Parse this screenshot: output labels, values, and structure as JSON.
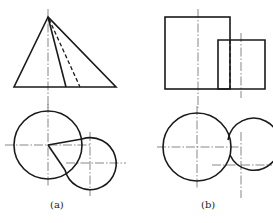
{
  "figure": {
    "line_color": "#1a1a1a",
    "centerline_color": "#555555",
    "panels": [
      {
        "id": "a",
        "caption": "(a)",
        "front_view": {
          "shape": "triangle (cone/pyramid front view)",
          "apex": [
            48,
            17
          ],
          "base_left": [
            14,
            87
          ],
          "base_right": [
            116,
            87
          ],
          "visible_edge_end": [
            66,
            87
          ],
          "hidden_edge_end": [
            80,
            87
          ],
          "centerline_x": 48
        },
        "top_view": {
          "large_circle": {
            "cx": 48,
            "cy": 145,
            "r": 34
          },
          "small_circle": {
            "cx": 90,
            "cy": 163,
            "r": 26
          },
          "radial_lines_to": [
            [
              82,
              139
            ],
            [
              65,
              170
            ]
          ]
        }
      },
      {
        "id": "b",
        "caption": "(b)",
        "front_view": {
          "large_rect": {
            "x": 165,
            "y": 17,
            "w": 65,
            "h": 72
          },
          "small_rect": {
            "x": 218,
            "y": 40,
            "w": 47,
            "h": 49
          },
          "hidden_line_x": 230,
          "centerlines_x": [
            198,
            241
          ]
        },
        "top_view": {
          "large_circle": {
            "cx": 197,
            "cy": 147,
            "r": 34
          },
          "small_circle": {
            "cx": 241,
            "cy": 165,
            "r": 26
          }
        }
      }
    ]
  }
}
